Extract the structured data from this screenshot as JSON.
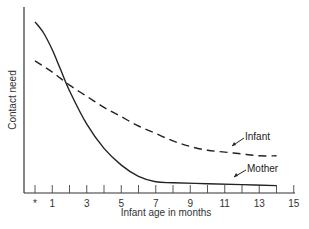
{
  "chart_data": {
    "type": "line",
    "title": "",
    "xlabel": "Infant age in months",
    "ylabel": "Contact need",
    "xlim": [
      0,
      15
    ],
    "x_tick_labels": [
      "*",
      "1",
      "3",
      "5",
      "7",
      "9",
      "11",
      "13",
      "15"
    ],
    "x_tick_values": [
      0,
      1,
      3,
      5,
      7,
      9,
      11,
      13,
      15
    ],
    "minor_ticks": [
      0,
      1,
      2,
      3,
      4,
      5,
      6,
      7,
      8,
      9,
      10,
      11,
      12,
      13,
      14,
      15
    ],
    "y_ticks": [],
    "grid": false,
    "legend": "inline labels with leader arrows at right",
    "series": [
      {
        "name": "Mother",
        "style": "solid",
        "x": [
          0,
          0.5,
          1,
          1.5,
          2,
          3,
          4,
          5,
          6,
          7,
          8,
          10,
          12,
          14
        ],
        "values": [
          0.92,
          0.86,
          0.77,
          0.66,
          0.55,
          0.37,
          0.24,
          0.15,
          0.09,
          0.06,
          0.055,
          0.05,
          0.045,
          0.04
        ]
      },
      {
        "name": "Infant",
        "style": "dashed",
        "x": [
          0,
          1,
          2,
          3,
          4,
          5,
          6,
          7,
          8,
          9,
          10,
          11,
          12,
          13,
          14
        ],
        "values": [
          0.71,
          0.65,
          0.58,
          0.52,
          0.46,
          0.41,
          0.36,
          0.32,
          0.28,
          0.25,
          0.23,
          0.22,
          0.21,
          0.2,
          0.2
        ]
      }
    ],
    "annotations": [
      {
        "text": "Infant",
        "points_to_x": 11.5
      },
      {
        "text": "Mother",
        "points_to_x": 11.5
      }
    ]
  }
}
